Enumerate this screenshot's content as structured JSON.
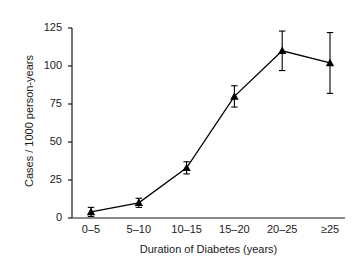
{
  "chart_data": {
    "type": "line",
    "title": "",
    "subtitle": "",
    "xlabel": "Duration of Diabetes (years)",
    "ylabel": "Cases / 1000 person-years",
    "categories": [
      "0–5",
      "5–10",
      "10–15",
      "15–20",
      "20–25",
      "≥25"
    ],
    "values": [
      4,
      10,
      33,
      80,
      110,
      102
    ],
    "error_upper": [
      3,
      3,
      4,
      7,
      13,
      20
    ],
    "error_lower": [
      3,
      3,
      4,
      7,
      13,
      20
    ],
    "yticks": [
      0,
      25,
      50,
      75,
      100,
      125
    ],
    "ylim": [
      0,
      125
    ],
    "grid": false,
    "legend": null,
    "marker": "triangle",
    "marker_color": "#000000",
    "line_color": "#000000"
  },
  "axes": {
    "y_tick_labels": [
      "125",
      "100",
      "75",
      "50",
      "25",
      "0"
    ],
    "x_tick_labels": [
      "0–5",
      "5–10",
      "10–15",
      "15–20",
      "20–25",
      "≥25"
    ],
    "y_axis_title": "Cases / 1000 person-years",
    "x_axis_title": "Duration of Diabetes (years)"
  },
  "style": {
    "background": "#ffffff",
    "ink": "#1a1a1a",
    "line": "#000000"
  }
}
